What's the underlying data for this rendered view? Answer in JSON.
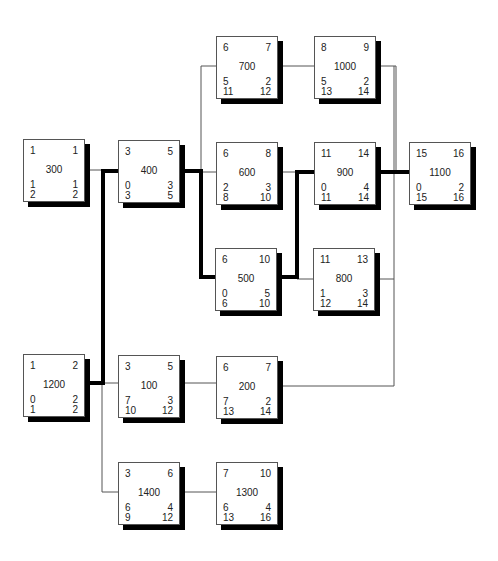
{
  "diagram": {
    "type": "activity-on-node network (critical path)",
    "colors": {
      "critical_link": "#000000",
      "normal_link": "#555555",
      "node_border": "#555555",
      "node_shadow": "#000000"
    },
    "nodes": {
      "n300": {
        "id": "300",
        "es": "1",
        "ef": "1",
        "slack": "1",
        "dur": "1",
        "ls": "2",
        "lf": "2"
      },
      "n400": {
        "id": "400",
        "es": "3",
        "ef": "5",
        "slack": "0",
        "dur": "3",
        "ls": "3",
        "lf": "5"
      },
      "n700": {
        "id": "700",
        "es": "6",
        "ef": "7",
        "slack": "5",
        "dur": "2",
        "ls": "11",
        "lf": "12"
      },
      "n1000": {
        "id": "1000",
        "es": "8",
        "ef": "9",
        "slack": "5",
        "dur": "2",
        "ls": "13",
        "lf": "14"
      },
      "n600": {
        "id": "600",
        "es": "6",
        "ef": "8",
        "slack": "2",
        "dur": "3",
        "ls": "8",
        "lf": "10"
      },
      "n900": {
        "id": "900",
        "es": "11",
        "ef": "14",
        "slack": "0",
        "dur": "4",
        "ls": "11",
        "lf": "14"
      },
      "n1100": {
        "id": "1100",
        "es": "15",
        "ef": "16",
        "slack": "0",
        "dur": "2",
        "ls": "15",
        "lf": "16"
      },
      "n500": {
        "id": "500",
        "es": "6",
        "ef": "10",
        "slack": "0",
        "dur": "5",
        "ls": "6",
        "lf": "10"
      },
      "n800": {
        "id": "800",
        "es": "11",
        "ef": "13",
        "slack": "1",
        "dur": "3",
        "ls": "12",
        "lf": "14"
      },
      "n1200": {
        "id": "1200",
        "es": "1",
        "ef": "2",
        "slack": "0",
        "dur": "2",
        "ls": "1",
        "lf": "2"
      },
      "n100": {
        "id": "100",
        "es": "3",
        "ef": "5",
        "slack": "7",
        "dur": "3",
        "ls": "10",
        "lf": "12"
      },
      "n200": {
        "id": "200",
        "es": "6",
        "ef": "7",
        "slack": "7",
        "dur": "2",
        "ls": "13",
        "lf": "14"
      },
      "n1400": {
        "id": "1400",
        "es": "3",
        "ef": "6",
        "slack": "6",
        "dur": "4",
        "ls": "9",
        "lf": "12"
      },
      "n1300": {
        "id": "1300",
        "es": "7",
        "ef": "10",
        "slack": "6",
        "dur": "4",
        "ls": "13",
        "lf": "16"
      }
    },
    "critical_path": [
      "1200",
      "400",
      "500",
      "900",
      "1100"
    ]
  }
}
